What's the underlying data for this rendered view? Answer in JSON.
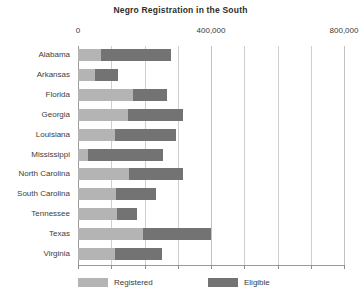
{
  "chart_data": {
    "type": "bar",
    "orientation": "horizontal",
    "stacked": true,
    "title": "Negro Registration in  the South",
    "xlabel": "",
    "ylabel": "",
    "xlim": [
      0,
      800000
    ],
    "grid": true,
    "gridlines": [
      0,
      100000,
      200000,
      300000,
      400000,
      500000,
      600000,
      700000,
      800000
    ],
    "tick_labels": [
      "0",
      "400,000",
      "800,000"
    ],
    "tick_values": [
      0,
      400000,
      800000
    ],
    "legend_position": "bottom",
    "legend": [
      "Registered",
      "Eligible"
    ],
    "colors": {
      "registered": "#b4b4b4",
      "eligible": "#737373",
      "gridline": "#cfcfcf",
      "axis": "#9a9a9a",
      "text": "#3a3a3a"
    },
    "categories": [
      "Alabama",
      "Arkansas",
      "Florida",
      "Georgia",
      "Louisiana",
      "Mississippi",
      "North Carolina",
      "South Carolina",
      "Tennessee",
      "Texas",
      "Virginia"
    ],
    "series": [
      {
        "name": "Registered",
        "values": [
          68000,
          50000,
          164000,
          151000,
          110000,
          31000,
          153000,
          115000,
          117000,
          195000,
          112000
        ]
      },
      {
        "name": "Eligible",
        "values": [
          212000,
          70000,
          104000,
          164000,
          185000,
          226000,
          162000,
          121000,
          59000,
          205000,
          140000
        ]
      }
    ],
    "totals": [
      280000,
      120000,
      268000,
      315000,
      295000,
      257000,
      315000,
      236000,
      176000,
      400000,
      252000
    ]
  }
}
